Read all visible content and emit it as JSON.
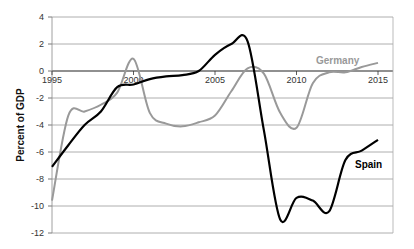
{
  "chart_data": {
    "type": "line",
    "title": "",
    "xlabel": "",
    "ylabel": "Percent of GDP",
    "xlim": [
      1995,
      2016
    ],
    "ylim": [
      -12,
      4
    ],
    "grid": true,
    "legend_position": "inline labels",
    "x_ticks": [
      "1995",
      "2000",
      "2005",
      "2010",
      "2015"
    ],
    "y_ticks": [
      "4",
      "2",
      "0",
      "-2",
      "-4",
      "-6",
      "-8",
      "-10",
      "-12"
    ],
    "x": [
      1995,
      1996,
      1997,
      1998,
      1999,
      2000,
      2001,
      2002,
      2003,
      2004,
      2005,
      2006,
      2007,
      2008,
      2009,
      2010,
      2011,
      2012,
      2013,
      2014,
      2015
    ],
    "series": [
      {
        "name": "Germany",
        "color": "#999999",
        "values": [
          -9.6,
          -3.3,
          -3.0,
          -2.5,
          -1.6,
          0.9,
          -3.1,
          -3.9,
          -4.1,
          -3.8,
          -3.3,
          -1.5,
          0.2,
          -0.2,
          -3.1,
          -4.2,
          -0.9,
          -0.1,
          -0.1,
          0.3,
          0.6
        ]
      },
      {
        "name": "Spain",
        "color": "#000000",
        "values": [
          -7.1,
          -5.5,
          -4.0,
          -3.0,
          -1.2,
          -1.0,
          -0.6,
          -0.4,
          -0.3,
          0.0,
          1.2,
          2.0,
          2.2,
          -4.4,
          -11.0,
          -9.4,
          -9.6,
          -10.4,
          -6.6,
          -5.9,
          -5.1
        ]
      }
    ],
    "annotations": [
      {
        "text": "Germany",
        "x": 2012.3,
        "y": 0.8
      },
      {
        "text": "Spain",
        "x": 2013.7,
        "y": -7.1
      }
    ]
  },
  "labels": {
    "ylabel": "Percent of GDP",
    "germany": "Germany",
    "spain": "Spain",
    "x_ticks": [
      "1995",
      "2000",
      "2005",
      "2010",
      "2015"
    ],
    "y_ticks": [
      "4",
      "2",
      "0",
      "-2",
      "-4",
      "-6",
      "-8",
      "-10",
      "-12"
    ]
  }
}
